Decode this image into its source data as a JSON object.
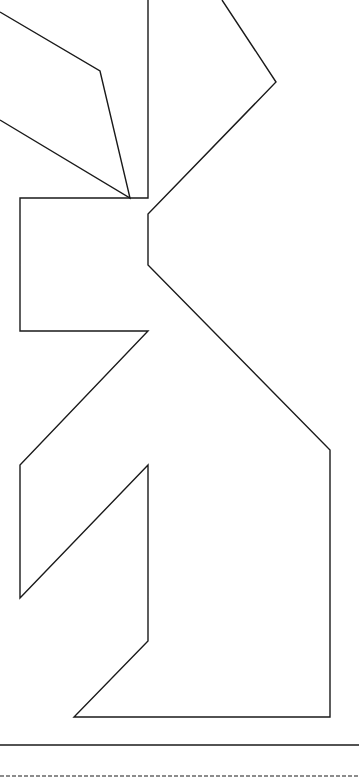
{
  "figure": {
    "type": "tangram-outline",
    "stroke_color": "#1a1a1a",
    "background": "#ffffff",
    "stroke_width": 1.4,
    "shapes": {
      "left_ear": "0,12 100,71 130,198 0,120",
      "main_outline": "148,0 148,198 20,198 20,331 148,331 20,465 20,598 148,465 148,641 74,717 330,717 330,450 148,265 148,214 276,82 222,0"
    },
    "baseline_solid_y": 745,
    "baseline_dashed_y": 776
  }
}
